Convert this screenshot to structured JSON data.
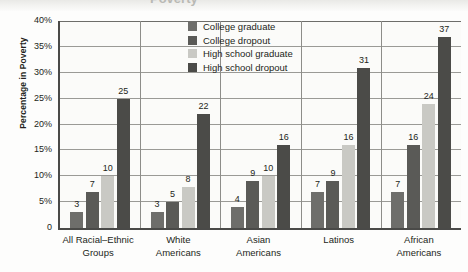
{
  "title_partial": "Poverty",
  "chart_data": {
    "type": "bar",
    "title": "",
    "xlabel": "",
    "ylabel": "Percentage in Poverty",
    "ylim": [
      0,
      40
    ],
    "grid": true,
    "legend_position": "top-center",
    "categories": [
      "All Racial–Ethnic Groups",
      "White Americans",
      "Asian Americans",
      "Latinos",
      "African Americans"
    ],
    "category_lines": [
      [
        "All Racial–Ethnic",
        "Groups"
      ],
      [
        "White",
        "Americans"
      ],
      [
        "Asian",
        "Americans"
      ],
      [
        "Latinos",
        ""
      ],
      [
        "African",
        "Americans"
      ]
    ],
    "ytick_labels": [
      "0",
      "5%",
      "10%",
      "15%",
      "20%",
      "25%",
      "30%",
      "35%",
      "40%"
    ],
    "ytick_values": [
      0,
      5,
      10,
      15,
      20,
      25,
      30,
      35,
      40
    ],
    "series": [
      {
        "name": "College graduate",
        "color": "#6e6e6b",
        "values": [
          3,
          3,
          4,
          7,
          7
        ]
      },
      {
        "name": "College dropout",
        "color": "#5a5a57",
        "values": [
          7,
          5,
          9,
          9,
          16
        ]
      },
      {
        "name": "High school graduate",
        "color": "#c9c9c4",
        "values": [
          10,
          8,
          10,
          16,
          24
        ]
      },
      {
        "name": "High school dropout",
        "color": "#4b4b48",
        "values": [
          25,
          22,
          16,
          31,
          37
        ]
      }
    ]
  },
  "colors": {
    "axis": "#4a4a48",
    "grid": "#9a9a96",
    "text": "#231f20",
    "plot_bg": "#fbfbf9"
  }
}
